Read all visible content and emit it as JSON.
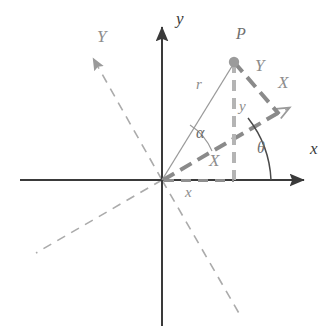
{
  "figure": {
    "background_color": "#ffffff",
    "width": 335,
    "height": 335
  },
  "colors": {
    "axis_dark": "#3a3a3a",
    "axis_gray": "#9a9a9a",
    "dashed_gray": "#a8a8a8",
    "thick_dashed": "#8a8a8a",
    "point_fill": "#9b9b9b",
    "radius_line": "#9a9a9a",
    "label_dark": "#3a3a3a",
    "label_gray": "#8d8d8d"
  },
  "axes": {
    "origin": {
      "x": 162,
      "y": 180
    },
    "x_axis": {
      "label": "x",
      "label_pos": {
        "x": 315,
        "y": 148
      },
      "start": {
        "x": 20,
        "y": 180
      },
      "end": {
        "x": 313,
        "y": 180
      },
      "style": "solid",
      "arrow": true
    },
    "y_axis": {
      "label": "y",
      "label_pos": {
        "x": 172,
        "y": 12
      },
      "start": {
        "x": 162,
        "y": 326
      },
      "end": {
        "x": 162,
        "y": 18
      },
      "style": "solid",
      "arrow": true
    },
    "X_axis_rotated": {
      "label": "X",
      "label_pos": {
        "x": 282,
        "y": 80
      },
      "origin": {
        "x": 162,
        "y": 180
      },
      "end": {
        "x": 295,
        "y": 103
      },
      "negative_end": {
        "x": 36,
        "y": 253
      },
      "style": "dashed",
      "arrow": true,
      "rotation_deg": 30
    },
    "Y_axis_rotated": {
      "label": "Y",
      "label_pos": {
        "x": 97,
        "y": 30
      },
      "origin": {
        "x": 162,
        "y": 180
      },
      "end": {
        "x": 88,
        "y": 50
      },
      "negative_end": {
        "x": 240,
        "y": 315
      },
      "style": "dashed",
      "arrow": true
    }
  },
  "point": {
    "name": "P",
    "label": "P",
    "label_pos": {
      "x": 236,
      "y": 28
    },
    "pos": {
      "x": 234,
      "y": 62
    },
    "radius_px": 5
  },
  "segments": {
    "radius": {
      "label": "r",
      "label_pos": {
        "x": 196,
        "y": 79
      },
      "from": {
        "x": 162,
        "y": 180
      },
      "to": {
        "x": 234,
        "y": 62
      },
      "style": "solid-thin"
    },
    "y_projection": {
      "label": "y",
      "label_pos": {
        "x": 237,
        "y": 100
      },
      "from": {
        "x": 234,
        "y": 62
      },
      "to": {
        "x": 234,
        "y": 180
      },
      "style": "dashed-thick"
    },
    "x_projection": {
      "label": "x",
      "label_pos": {
        "x": 186,
        "y": 186
      },
      "from": {
        "x": 162,
        "y": 180
      },
      "to": {
        "x": 234,
        "y": 180
      },
      "style": "dotted"
    },
    "X_component": {
      "label": "X",
      "label_pos": {
        "x": 210,
        "y": 153
      },
      "from": {
        "x": 162,
        "y": 180
      },
      "to": {
        "x": 278,
        "y": 113
      },
      "style": "dashed-thick"
    },
    "Y_component": {
      "label": "Y",
      "label_pos": {
        "x": 258,
        "y": 60
      },
      "from": {
        "x": 234,
        "y": 62
      },
      "to": {
        "x": 278,
        "y": 113
      },
      "style": "dashed-thick"
    }
  },
  "angles": {
    "alpha": {
      "label": "α",
      "label_pos": {
        "x": 198,
        "y": 126
      },
      "vertex": {
        "x": 162,
        "y": 180
      },
      "from_deg": 30,
      "to_deg": 58.6,
      "description": "angle between rotated X axis and radius r"
    },
    "theta": {
      "label": "θ",
      "label_pos": {
        "x": 258,
        "y": 142
      },
      "vertex": {
        "x": 271,
        "y": 180
      },
      "arc_from": {
        "x": 271,
        "y": 180
      },
      "arc_to": {
        "x": 252,
        "y": 122
      },
      "description": "angle of rotation between x axis and X axis"
    }
  },
  "labels": [
    {
      "key": "x_axis",
      "text": "x",
      "tone": "dark"
    },
    {
      "key": "y_axis",
      "text": "y",
      "tone": "dark"
    },
    {
      "key": "X_axis",
      "text": "X",
      "tone": "gray"
    },
    {
      "key": "Y_axis",
      "text": "Y",
      "tone": "gray"
    },
    {
      "key": "point_P",
      "text": "P",
      "tone": "gray"
    },
    {
      "key": "radius_r",
      "text": "r",
      "tone": "gray"
    },
    {
      "key": "proj_y",
      "text": "y",
      "tone": "gray"
    },
    {
      "key": "proj_x",
      "text": "x",
      "tone": "gray"
    },
    {
      "key": "comp_X",
      "text": "X",
      "tone": "gray"
    },
    {
      "key": "comp_Y",
      "text": "Y",
      "tone": "gray"
    },
    {
      "key": "angle_alpha",
      "text": "α",
      "tone": "gray"
    },
    {
      "key": "angle_theta",
      "text": "θ",
      "tone": "gray"
    }
  ]
}
